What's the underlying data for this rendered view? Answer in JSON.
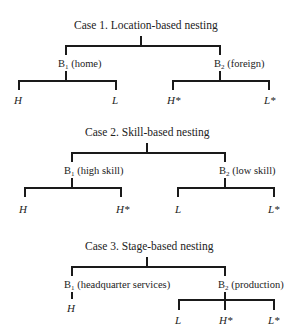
{
  "cases": [
    {
      "title": "Case 1. Location-based nesting",
      "b1": {
        "prefix": "B",
        "sub": "1",
        "label": " (home)",
        "leaves": [
          "H",
          "L"
        ]
      },
      "b2": {
        "prefix": "B",
        "sub": "2",
        "label": " (foreign)",
        "leaves": [
          "H*",
          "L*"
        ]
      }
    },
    {
      "title": "Case 2. Skill-based nesting",
      "b1": {
        "prefix": "B",
        "sub": "1",
        "label": " (high skill)",
        "leaves": [
          "H",
          "H*"
        ]
      },
      "b2": {
        "prefix": "B",
        "sub": "2",
        "label": " (low skill)",
        "leaves": [
          "L",
          "L*"
        ]
      }
    },
    {
      "title": "Case 3. Stage-based nesting",
      "b1": {
        "prefix": "B",
        "sub": "1",
        "label": " (headquarter services)",
        "leaves": [
          "H"
        ]
      },
      "b2": {
        "prefix": "B",
        "sub": "2",
        "label": " (production)",
        "leaves": [
          "L",
          "H*",
          "L*"
        ]
      }
    }
  ]
}
